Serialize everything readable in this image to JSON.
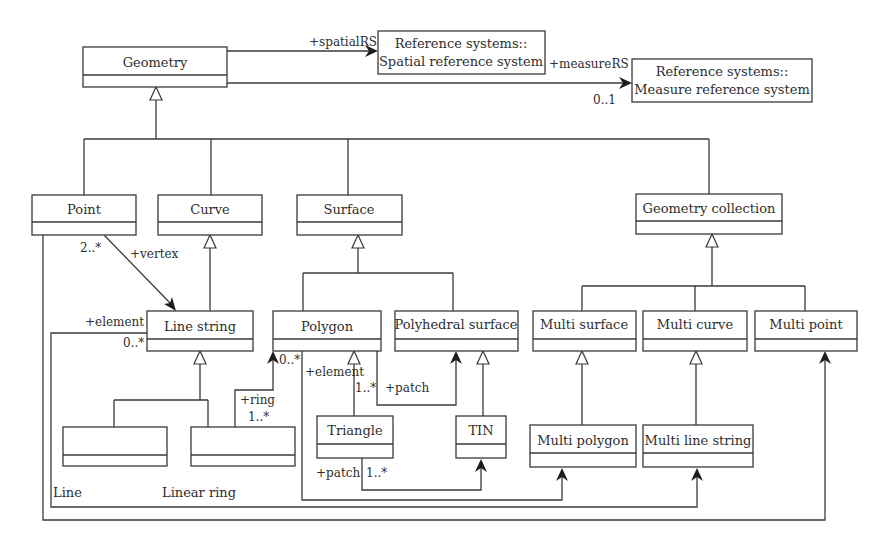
{
  "diagram": {
    "type": "UML class diagram",
    "classes": {
      "geometry": "Geometry",
      "spatial_rs_line1": "Reference systems::",
      "spatial_rs_line2": "Spatial reference system",
      "measure_rs_line1": "Reference systems::",
      "measure_rs_line2": "Measure reference system",
      "point": "Point",
      "curve": "Curve",
      "surface": "Surface",
      "geometry_collection": "Geometry collection",
      "line_string": "Line string",
      "polygon": "Polygon",
      "polyhedral_surface": "Polyhedral surface",
      "multi_surface": "Multi surface",
      "multi_curve": "Multi curve",
      "multi_point": "Multi point",
      "line": "Line",
      "linear_ring": "Linear ring",
      "triangle": "Triangle",
      "tin": "TIN",
      "multi_polygon": "Multi polygon",
      "multi_line_string": "Multi line string"
    },
    "associations": {
      "spatial_rs_role": "+spatialRS",
      "measure_rs_role": "+measureRS",
      "measure_rs_mult": "0..1",
      "vertex_mult": "2..*",
      "vertex_role": "+vertex",
      "ls_element_role": "+element",
      "ls_element_mult": "0..*",
      "ring_role": "+ring",
      "ring_mult": "1..*",
      "poly_element_mult": "0..*",
      "poly_element_role": "+element",
      "poly_patch_mult": "1..*",
      "poly_patch_role": "+patch",
      "tri_patch_role": "+patch",
      "tri_patch_mult": "1..*"
    }
  }
}
